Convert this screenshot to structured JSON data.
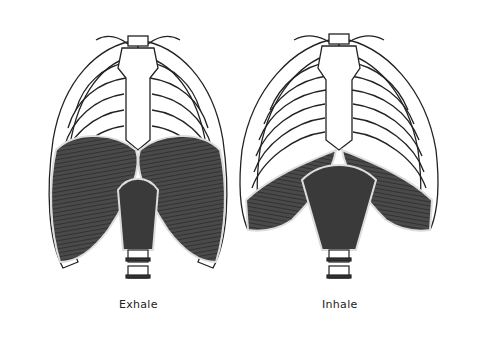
{
  "figures": [
    {
      "id": "exhale",
      "label": "Exhale",
      "diaphragm_shape": "domed-high"
    },
    {
      "id": "inhale",
      "label": "Inhale",
      "diaphragm_shape": "flattened-low"
    }
  ],
  "colors": {
    "outline": "#222222",
    "bone_fill": "#ffffff",
    "muscle_dark": "#3a3a3a",
    "muscle_mid": "#5a5a5a",
    "background": "#ffffff"
  }
}
